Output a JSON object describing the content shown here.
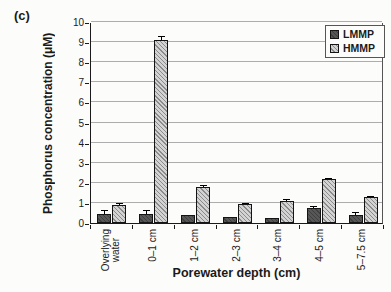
{
  "figure_label": "(c)",
  "chart_data": {
    "type": "bar",
    "title": "",
    "xlabel": "Porewater depth (cm)",
    "ylabel": "Phosphorus concentration (μM)",
    "ylim": [
      0,
      10
    ],
    "ytick_interval": 1,
    "grid": true,
    "legend_position": "top-right",
    "categories": [
      "Overlying\nwater",
      "0–1 cm",
      "1–2 cm",
      "2–3 cm",
      "3–4 cm",
      "4–5 cm",
      "5–7.5 cm"
    ],
    "series": [
      {
        "name": "LMMP",
        "fill": "dark-solid-texture",
        "color": "#4a4a4a",
        "values": [
          0.45,
          0.45,
          0.4,
          0.3,
          0.25,
          0.75,
          0.4
        ],
        "errors": [
          0.2,
          0.2,
          0,
          0,
          0,
          0.1,
          0.15
        ]
      },
      {
        "name": "HMMP",
        "fill": "diagonal-hatch",
        "color": "#c4c4c4",
        "hatch_color": "#8b8b8b",
        "values": [
          0.9,
          9.1,
          1.8,
          0.95,
          1.1,
          2.2,
          1.3
        ],
        "errors": [
          0.12,
          0.2,
          0.07,
          0.04,
          0.1,
          0.06,
          0.05
        ]
      }
    ]
  },
  "colors": {
    "background": "#fcfcfa",
    "gridline": "#adadad",
    "axis": "#1a1a1a"
  }
}
